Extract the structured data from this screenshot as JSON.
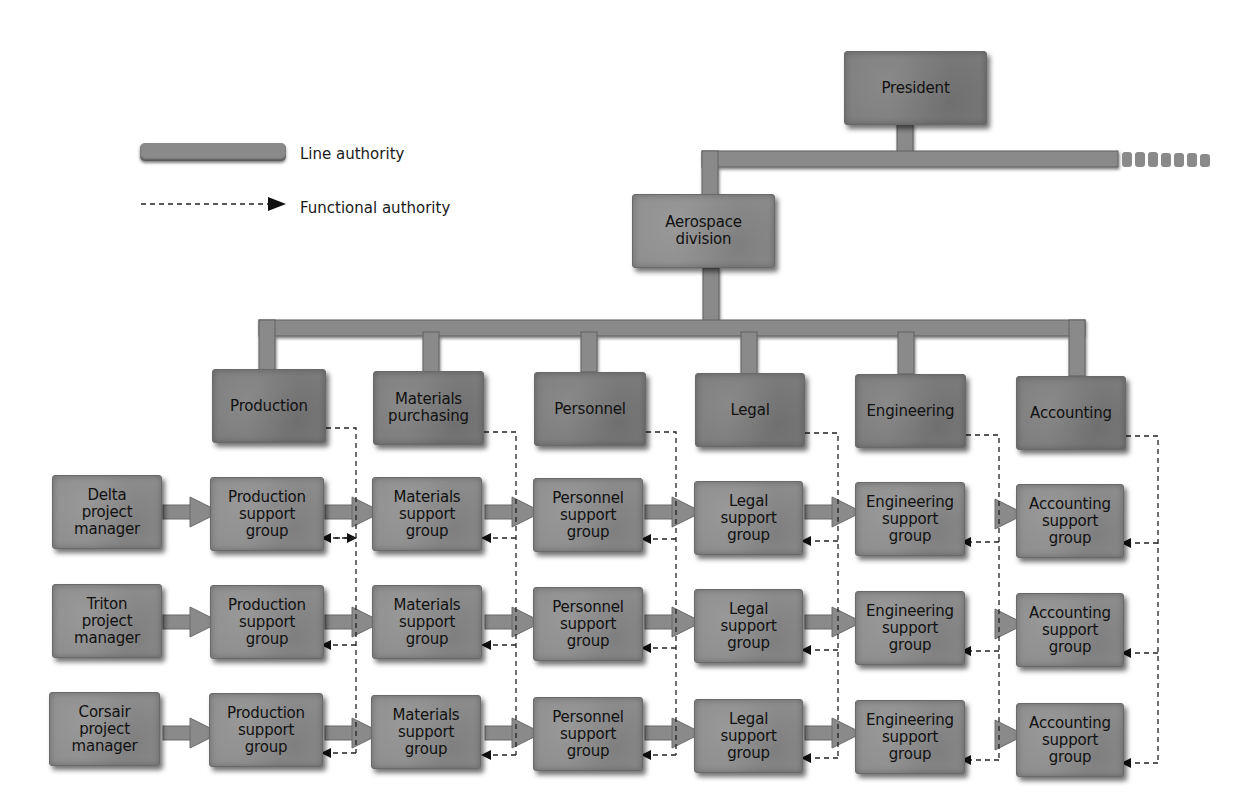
{
  "legend": {
    "line_label": "Line authority",
    "functional_label": "Functional authority"
  },
  "colors": {
    "box_fill": "#8d8d8d",
    "connector_fill": "#8a8a8a",
    "dashed_line": "#222222",
    "background": "#ffffff"
  },
  "top": {
    "president": "President",
    "division": "Aerospace\ndivision"
  },
  "departments": [
    {
      "label": "Production"
    },
    {
      "label": "Materials\npurchasing"
    },
    {
      "label": "Personnel"
    },
    {
      "label": "Legal"
    },
    {
      "label": "Engineering"
    },
    {
      "label": "Accounting"
    }
  ],
  "project_managers": [
    {
      "label": "Delta\nproject\nmanager"
    },
    {
      "label": "Triton\nproject\nmanager"
    },
    {
      "label": "Corsair\nproject\nmanager"
    }
  ],
  "support_groups": [
    {
      "label": "Production\nsupport\ngroup"
    },
    {
      "label": "Materials\nsupport\ngroup"
    },
    {
      "label": "Personnel\nsupport\ngroup"
    },
    {
      "label": "Legal\nsupport\ngroup"
    },
    {
      "label": "Engineering\nsupport\ngroup"
    },
    {
      "label": "Accounting\nsupport\ngroup"
    }
  ]
}
